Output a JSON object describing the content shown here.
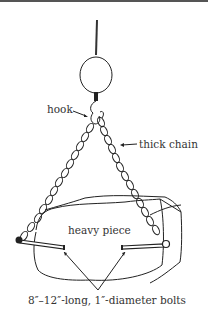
{
  "diagram": {
    "labels": {
      "hook": "hook",
      "chain": "thick chain",
      "piece": "heavy piece",
      "bolts": "8″–12″-long, 1″-diameter bolts"
    },
    "colors": {
      "line": "#222222",
      "text": "#333333",
      "background": "#ffffff"
    }
  }
}
